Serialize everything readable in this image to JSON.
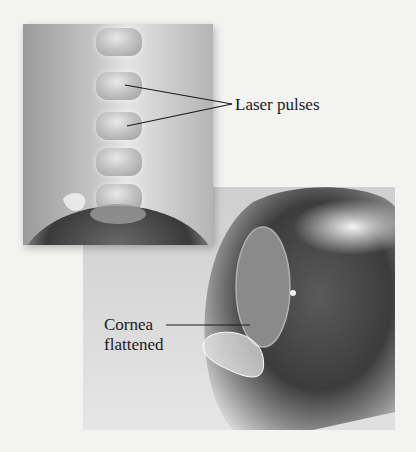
{
  "figure": {
    "labels": {
      "laser_pulses": "Laser pulses",
      "cornea_line1": "Cornea",
      "cornea_line2": "flattened"
    },
    "panels": [
      {
        "name": "laser-pulses-view",
        "description": "Stack of laser pulses descending onto eye"
      },
      {
        "name": "flattened-cornea-view",
        "description": "Side view of eye with flattened cornea"
      }
    ],
    "colors": {
      "background": "#f3f3f1",
      "text": "#1a1a1a",
      "eye_dark": "#3a3a3a",
      "cornea": "#8a8a8a"
    }
  }
}
